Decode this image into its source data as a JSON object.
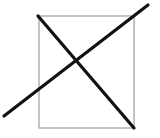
{
  "diagram": {
    "canvas": {
      "width": 160,
      "height": 138,
      "background": "#ffffff"
    },
    "rectangle": {
      "x": 39,
      "y": 16,
      "width": 95,
      "height": 112,
      "stroke": "#8a8a8a",
      "stroke_width": 1
    },
    "lines": [
      {
        "x1": 38,
        "y1": 16,
        "x2": 134,
        "y2": 128,
        "stroke": "#111111",
        "stroke_width": 3.2
      },
      {
        "x1": 4,
        "y1": 116,
        "x2": 148,
        "y2": 5,
        "stroke": "#111111",
        "stroke_width": 3.2
      }
    ]
  }
}
